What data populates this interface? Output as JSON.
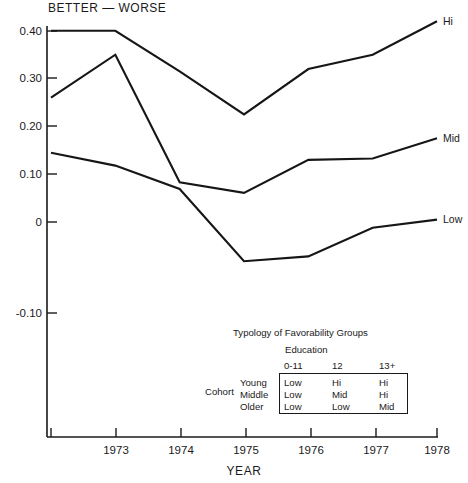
{
  "chart_data": {
    "type": "line",
    "title": "BETTER — WORSE",
    "xlabel": "YEAR",
    "ylabel": "",
    "x": [
      1972,
      1973,
      1974,
      1975,
      1976,
      1977,
      1978
    ],
    "xtick_labels": [
      "",
      "1973",
      "1974",
      "1975",
      "1976",
      "1977",
      "1978"
    ],
    "ytick_labels": [
      "0.40",
      "0.30",
      "0.20",
      "0.10",
      "0",
      "-0.10"
    ],
    "ytick_values": [
      0.4,
      0.3,
      0.2,
      0.1,
      0,
      -0.1
    ],
    "xlim": [
      1972,
      1978
    ],
    "ylim": [
      -0.135,
      0.435
    ],
    "grid": false,
    "legend_position": "right-end-labels",
    "series": [
      {
        "name": "Hi",
        "label": "Hi",
        "values": [
          0.4,
          0.4,
          0.315,
          0.225,
          0.32,
          0.35,
          0.42
        ]
      },
      {
        "name": "Mid",
        "label": "Mid",
        "values": [
          0.26,
          0.35,
          0.083,
          0.061,
          0.13,
          0.133,
          0.175
        ]
      },
      {
        "name": "Low",
        "label": "Low",
        "values": [
          0.145,
          0.118,
          0.069,
          -0.082,
          -0.072,
          -0.012,
          0.005
        ]
      }
    ]
  },
  "legend": {
    "title": "Typology of Favorability Groups",
    "education_label": "Education",
    "cohort_label": "Cohort",
    "education_levels": [
      "0-11",
      "12",
      "13+"
    ],
    "cohort_rows": [
      "Young",
      "Middle",
      "Older"
    ],
    "matrix": [
      [
        "Low",
        "Hi",
        "Hi"
      ],
      [
        "Low",
        "Mid",
        "Hi"
      ],
      [
        "Low",
        "Low",
        "Mid"
      ]
    ]
  }
}
